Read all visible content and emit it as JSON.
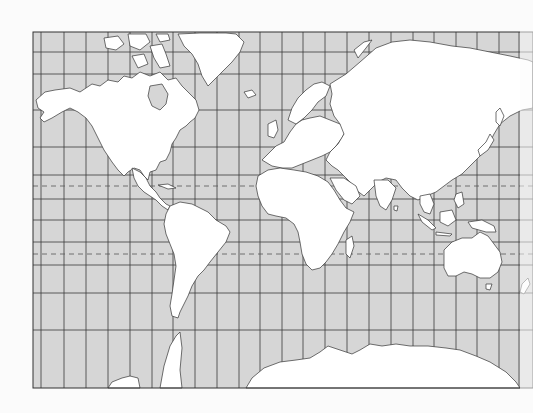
{
  "map": {
    "projection": "Mercator",
    "type": "world outline map",
    "colors": {
      "page_background": "#fbfbfb",
      "ocean": "#d6d6d6",
      "land": "#ffffff",
      "coastline": "#333333",
      "grid": "#3a3a3a",
      "tropic_dash": "#555555"
    },
    "frame": {
      "left": 33,
      "top": 32,
      "right": 533,
      "bottom": 388
    },
    "graticule": {
      "meridians_x": [
        41,
        64,
        86,
        108,
        130,
        152,
        173,
        195,
        217,
        239,
        260,
        282,
        303,
        325,
        347,
        369,
        391,
        413,
        434,
        456,
        477,
        499,
        519
      ],
      "parallels_y": [
        52,
        74,
        110,
        147,
        175,
        199,
        220,
        242,
        265,
        293,
        330
      ]
    },
    "special_parallels": [
      {
        "name": "Tropic of Cancer",
        "y": 186,
        "style": "dashed"
      },
      {
        "name": "Tropic of Capricorn",
        "y": 254,
        "style": "dashed"
      }
    ],
    "landmasses": [
      "North America",
      "Greenland",
      "South America",
      "Europe",
      "Africa",
      "Asia",
      "Australia",
      "Antarctica"
    ],
    "labels": []
  }
}
